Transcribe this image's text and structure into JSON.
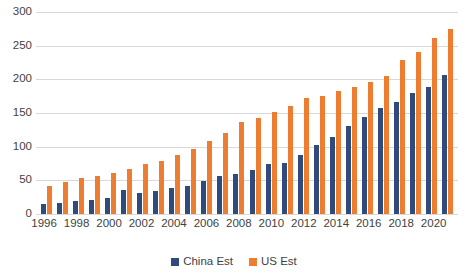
{
  "chart_data": {
    "type": "bar",
    "title": "",
    "subtitle": "",
    "xlabel": "",
    "ylabel": "",
    "ylim": [
      0,
      300
    ],
    "yticks": [
      0,
      50,
      100,
      150,
      200,
      250,
      300
    ],
    "grid": true,
    "legend_position": "bottom",
    "categories": [
      "1996",
      "1997",
      "1998",
      "1999",
      "2000",
      "2001",
      "2002",
      "2003",
      "2004",
      "2005",
      "2006",
      "2007",
      "2008",
      "2009",
      "2010",
      "2011",
      "2012",
      "2013",
      "2014",
      "2015",
      "2016",
      "2017",
      "2018",
      "2019",
      "2020",
      "2021"
    ],
    "xtick_labels": [
      "1996",
      "1998",
      "2000",
      "2002",
      "2004",
      "2006",
      "2008",
      "2010",
      "2012",
      "2014",
      "2016",
      "2018",
      "2020"
    ],
    "series": [
      {
        "name": "China Est",
        "color": "#2f4b7c",
        "values": [
          15,
          17,
          19,
          21,
          24,
          36,
          31,
          34,
          39,
          41,
          49,
          57,
          59,
          66,
          75,
          76,
          88,
          102,
          115,
          131,
          144,
          157,
          166,
          180,
          188,
          207
        ]
      },
      {
        "name": "US Est",
        "color": "#ed7d31",
        "values": [
          41,
          48,
          54,
          57,
          61,
          67,
          74,
          79,
          87,
          97,
          109,
          120,
          137,
          142,
          151,
          160,
          173,
          176,
          183,
          188,
          196,
          205,
          229,
          241,
          261,
          275
        ]
      }
    ]
  },
  "legend": {
    "items": [
      {
        "label": "China Est",
        "color": "#2f4b7c"
      },
      {
        "label": "US Est",
        "color": "#ed7d31"
      }
    ]
  }
}
